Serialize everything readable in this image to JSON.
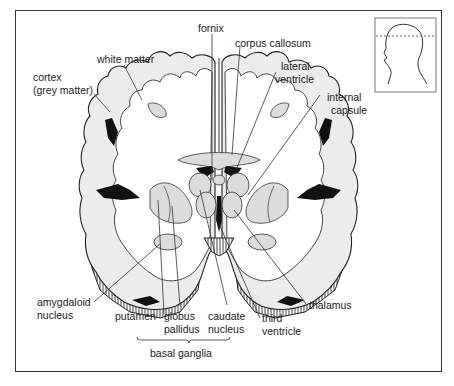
{
  "figure": {
    "labels": {
      "fornix": "fornix",
      "corpus_callosum": "corpus callosum",
      "white_matter": "white matter",
      "lateral_ventricle_1": "lateral",
      "lateral_ventricle_2": "ventricle",
      "cortex_1": "cortex",
      "cortex_2": "(grey matter)",
      "internal_capsule_1": "internal",
      "internal_capsule_2": "capsule",
      "amygdaloid_1": "amygdaloid",
      "amygdaloid_2": "nucleus",
      "putamen": "putamen",
      "globus_1": "globus",
      "globus_2": "pallidus",
      "caudate_1": "caudate",
      "caudate_2": "nucleus",
      "third_ventricle_1": "third",
      "third_ventricle_2": "ventricle",
      "thalamus": "thalamus",
      "basal_ganglia": "basal ganglia"
    },
    "inset": {
      "description": "head profile with dashed section line"
    }
  }
}
